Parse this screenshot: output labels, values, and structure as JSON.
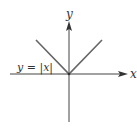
{
  "chart_data": {
    "type": "line",
    "title": "",
    "xlabel": "x",
    "ylabel": "y",
    "function_label": "y = |x|",
    "series": [
      {
        "name": "y = |x|",
        "x": [
          -1,
          0,
          1
        ],
        "y": [
          1,
          0,
          1
        ]
      }
    ],
    "xlim": [
      -1.8,
      1.8
    ],
    "ylim": [
      -1.5,
      1.5
    ],
    "grid": false,
    "legend": "none",
    "colors": {
      "line": "#666666",
      "axes": "#444444",
      "text": "#333333"
    }
  }
}
